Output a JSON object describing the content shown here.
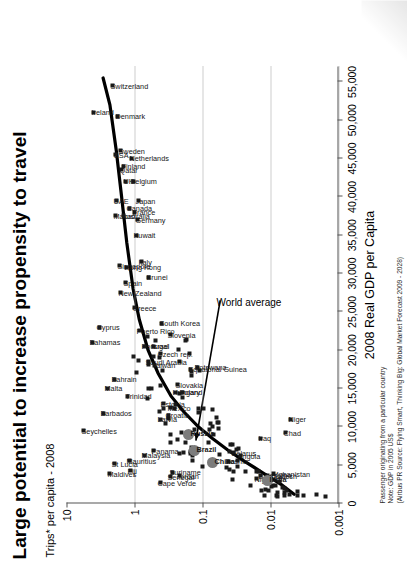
{
  "title": "Large potential to increase propensity to travel",
  "y_axis_label": "Trips* per capita - 2008",
  "footer": {
    "line1": "Passenger originating from a particular country",
    "line2": "Note: GDP in 2005 US$",
    "line3": "(Airbus PR Source: Flying Smart, Thinking Big: Global Market Forecast 2009 - 2028)"
  },
  "annotation": {
    "world_average": "World average"
  },
  "chart_data": {
    "type": "scatter",
    "title": "Large potential to increase propensity to travel",
    "subtitle": "Trips* per capita - 2008",
    "xlabel": "2008 Real GDP per Capita",
    "ylabel": "Trips* per capita - 2008",
    "xlim": [
      0,
      57000
    ],
    "ylim": [
      0.001,
      10
    ],
    "yscale": "log",
    "xscale": "linear",
    "grid": "dotted-horizontal",
    "legend": "none",
    "xticks": [
      "0",
      "5,000",
      "10,000",
      "15,000",
      "20,000",
      "25,000",
      "30,000",
      "35,000",
      "40,000",
      "45,000",
      "50,000",
      "55,000"
    ],
    "xtick_values": [
      0,
      5000,
      10000,
      15000,
      20000,
      25000,
      30000,
      35000,
      40000,
      45000,
      50000,
      55000
    ],
    "yticks": [
      "10",
      "1",
      "0.1",
      "0.01",
      "0.001"
    ],
    "ytick_values": [
      10,
      1,
      0.1,
      0.01,
      0.001
    ],
    "annotations": [
      {
        "text": "World average",
        "x": 26500,
        "y": 0.055,
        "points_to_x": 8200,
        "points_to_y": 0.125
      }
    ],
    "trend_line": {
      "name": "fitted propensity curve",
      "points": [
        [
          1200,
          0.0045
        ],
        [
          2500,
          0.007
        ],
        [
          4000,
          0.013
        ],
        [
          5500,
          0.024
        ],
        [
          7000,
          0.043
        ],
        [
          8500,
          0.072
        ],
        [
          10000,
          0.115
        ],
        [
          12000,
          0.19
        ],
        [
          14000,
          0.29
        ],
        [
          17000,
          0.45
        ],
        [
          20000,
          0.63
        ],
        [
          24000,
          0.85
        ],
        [
          28000,
          1.05
        ],
        [
          34000,
          1.3
        ],
        [
          40000,
          1.55
        ],
        [
          46000,
          1.85
        ],
        [
          52000,
          2.3
        ],
        [
          55500,
          2.9
        ]
      ]
    },
    "highlighted_points": [
      {
        "label": "Brazil",
        "x": 6900,
        "y": 0.13,
        "kind": "bric"
      },
      {
        "label": "Russia",
        "x": 9000,
        "y": 0.16,
        "kind": "bric"
      },
      {
        "label": "China",
        "x": 5400,
        "y": 0.072,
        "kind": "bric"
      },
      {
        "label": "India",
        "x": 3000,
        "y": 0.011,
        "kind": "bric"
      }
    ],
    "points": [
      {
        "label": "Seychelles",
        "x": 9500,
        "y": 5.6
      },
      {
        "label": "Bahamas",
        "x": 21000,
        "y": 4.2
      },
      {
        "label": "Maldives",
        "x": 3900,
        "y": 2.3
      },
      {
        "label": "Barbados",
        "x": 11800,
        "y": 2.9
      },
      {
        "label": "Malta",
        "x": 15000,
        "y": 2.5
      },
      {
        "label": "Cyprus",
        "x": 23000,
        "y": 3.3
      },
      {
        "label": "St Lucia",
        "x": 5200,
        "y": 2.0
      },
      {
        "label": "Ireland",
        "x": 51000,
        "y": 4.0
      },
      {
        "label": "Bahrain",
        "x": 16200,
        "y": 2.0
      },
      {
        "label": "Switzerland",
        "x": 54500,
        "y": 2.1
      },
      {
        "label": "Denmark",
        "x": 50500,
        "y": 1.75
      },
      {
        "label": "Fiji",
        "x": 4300,
        "y": 1.15
      },
      {
        "label": "Mauritius",
        "x": 5600,
        "y": 1.2
      },
      {
        "label": "Trinidad",
        "x": 14000,
        "y": 1.25
      },
      {
        "label": "New Zealand",
        "x": 27500,
        "y": 1.6
      },
      {
        "label": "Singapore",
        "x": 31000,
        "y": 1.65
      },
      {
        "label": "Macao",
        "x": 37500,
        "y": 1.9
      },
      {
        "label": "UAE",
        "x": 39500,
        "y": 1.85
      },
      {
        "label": "Spain",
        "x": 28800,
        "y": 1.35
      },
      {
        "label": "Hong Kong",
        "x": 30800,
        "y": 1.3
      },
      {
        "label": "Australia",
        "x": 37500,
        "y": 1.45
      },
      {
        "label": "USA",
        "x": 45500,
        "y": 1.9
      },
      {
        "label": "Sweden",
        "x": 46000,
        "y": 1.6
      },
      {
        "label": "Qatar",
        "x": 43500,
        "y": 1.55
      },
      {
        "label": "Finland",
        "x": 44000,
        "y": 1.45
      },
      {
        "label": "UK",
        "x": 42000,
        "y": 1.35
      },
      {
        "label": "Canada",
        "x": 38500,
        "y": 1.2
      },
      {
        "label": "Netherlands",
        "x": 45000,
        "y": 1.1
      },
      {
        "label": "Belgium",
        "x": 42000,
        "y": 1.05
      },
      {
        "label": "France",
        "x": 38000,
        "y": 1.0
      },
      {
        "label": "Germany",
        "x": 37000,
        "y": 0.9
      },
      {
        "label": "Japan",
        "x": 39500,
        "y": 0.88
      },
      {
        "label": "Kuwait",
        "x": 35000,
        "y": 0.95
      },
      {
        "label": "Italy",
        "x": 31500,
        "y": 0.8
      },
      {
        "label": "Greece",
        "x": 25500,
        "y": 1.0
      },
      {
        "label": "Puerto Rico",
        "x": 22500,
        "y": 0.85
      },
      {
        "label": "Brunei",
        "x": 29500,
        "y": 0.62
      },
      {
        "label": "Portugal",
        "x": 20500,
        "y": 0.72
      },
      {
        "label": "Saudi Arabia",
        "x": 18500,
        "y": 0.63
      },
      {
        "label": "Israel",
        "x": 20500,
        "y": 0.52
      },
      {
        "label": "Taiwan",
        "x": 18000,
        "y": 0.5
      },
      {
        "label": "South Korea",
        "x": 23500,
        "y": 0.4
      },
      {
        "label": "Czech rep.",
        "x": 19500,
        "y": 0.42
      },
      {
        "label": "Slovenia",
        "x": 22000,
        "y": 0.3
      },
      {
        "label": "Malaysia",
        "x": 6300,
        "y": 0.72
      },
      {
        "label": "Estonia",
        "x": 13000,
        "y": 0.38
      },
      {
        "label": "Latvia",
        "x": 11000,
        "y": 0.42
      },
      {
        "label": "Croatia",
        "x": 11500,
        "y": 0.32
      },
      {
        "label": "Mexico",
        "x": 12500,
        "y": 0.3
      },
      {
        "label": "Hungary",
        "x": 14500,
        "y": 0.25
      },
      {
        "label": "Slovakia",
        "x": 15500,
        "y": 0.23
      },
      {
        "label": "Poland",
        "x": 14500,
        "y": 0.2
      },
      {
        "label": "Equatorial Guinea",
        "x": 17500,
        "y": 0.15
      },
      {
        "label": "Botswana",
        "x": 17800,
        "y": 0.12
      },
      {
        "label": "Panama",
        "x": 6900,
        "y": 0.52
      },
      {
        "label": "Cape Verde",
        "x": 2700,
        "y": 0.42
      },
      {
        "label": "Senegal",
        "x": 3500,
        "y": 0.3
      },
      {
        "label": "Suriname",
        "x": 4100,
        "y": 0.28
      },
      {
        "label": "Jordan",
        "x": 3600,
        "y": 0.22
      },
      {
        "label": "Bosnia",
        "x": 5500,
        "y": 0.042
      },
      {
        "label": "Belarus",
        "x": 6600,
        "y": 0.035
      },
      {
        "label": "Angola",
        "x": 6200,
        "y": 0.028
      },
      {
        "label": "Nigeria",
        "x": 3200,
        "y": 0.016
      },
      {
        "label": "Bangladesh",
        "x": 3600,
        "y": 0.014
      },
      {
        "label": "Lesotho",
        "x": 3700,
        "y": 0.011
      },
      {
        "label": "Afghanistan",
        "x": 3900,
        "y": 0.009
      },
      {
        "label": "Iraq",
        "x": 8500,
        "y": 0.014
      },
      {
        "label": "Chad",
        "x": 9200,
        "y": 0.006
      },
      {
        "label": "Niger",
        "x": 11000,
        "y": 0.005
      }
    ],
    "unlabeled_point_count": 95
  }
}
